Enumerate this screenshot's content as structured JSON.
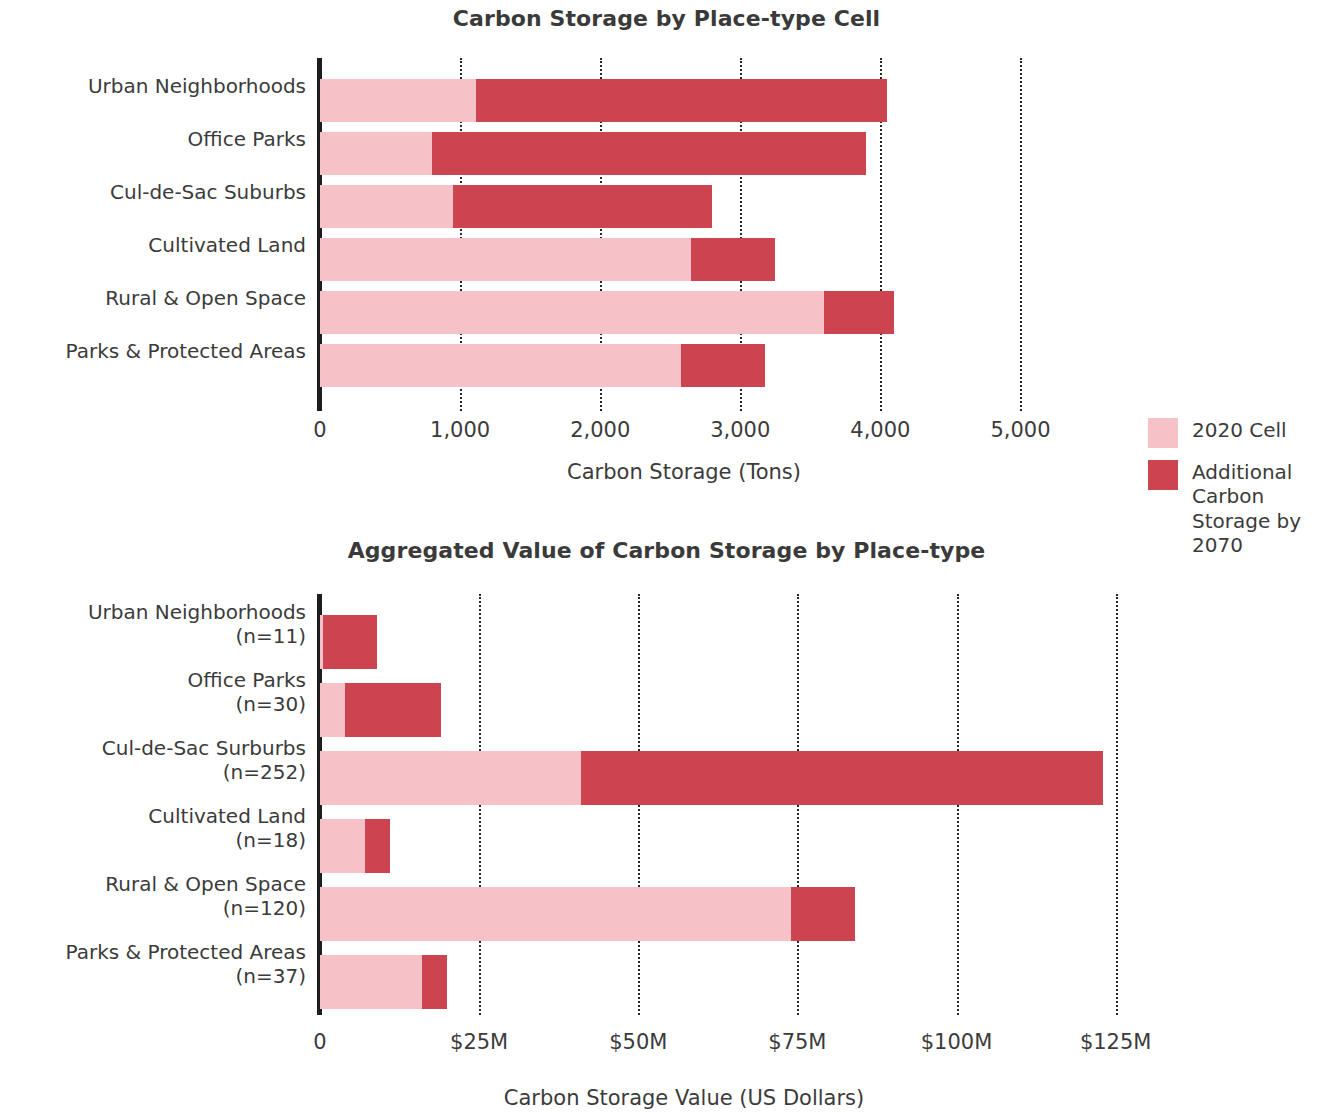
{
  "legend": {
    "items": [
      {
        "label": "2020 Cell",
        "color": "#f6c2c8",
        "key": "base"
      },
      {
        "label": "Additional Carbon Storage by 2070",
        "color": "#cc4450",
        "key": "additional"
      }
    ]
  },
  "charts": [
    {
      "id": "carbon-storage-by-cell",
      "title": "Carbon Storage by Place-type Cell",
      "xlabel": "Carbon Storage (Tons)",
      "ticks": [
        "0",
        "1,000",
        "2,000",
        "3,000",
        "4,000",
        "5,000"
      ],
      "categories": [
        "Urban Neighborhoods",
        "Office Parks",
        "Cul-de-Sac Suburbs",
        "Cultivated Land",
        "Rural & Open Space",
        "Parks & Protected Areas"
      ],
      "sublabels": [
        "",
        "",
        "",
        "",
        "",
        ""
      ]
    },
    {
      "id": "aggregated-value-by-placetype",
      "title": "Aggregated Value of Carbon Storage by Place-type",
      "xlabel": "Carbon Storage Value (US Dollars)",
      "ticks": [
        "0",
        "$25M",
        "$50M",
        "$75M",
        "$100M",
        "$125M"
      ],
      "categories": [
        "Urban Neighborhoods",
        "Office Parks",
        "Cul-de-Sac Surburbs",
        "Cultivated Land",
        "Rural & Open Space",
        "Parks & Protected Areas"
      ],
      "sublabels": [
        "(n=11)",
        "(n=30)",
        "(n=252)",
        "(n=18)",
        "(n=120)",
        "(n=37)"
      ]
    }
  ],
  "chart_data": [
    {
      "type": "bar",
      "orientation": "horizontal",
      "stacked": true,
      "title": "Carbon Storage by Place-type Cell",
      "xlabel": "Carbon Storage (Tons)",
      "ylabel": "",
      "xlim": [
        0,
        5200
      ],
      "xticks": [
        0,
        1000,
        2000,
        3000,
        4000,
        5000
      ],
      "xticklabels": [
        "0",
        "1,000",
        "2,000",
        "3,000",
        "4,000",
        "5,000"
      ],
      "grid": "x-dotted",
      "legend_position": "right",
      "categories": [
        "Urban Neighborhoods",
        "Office Parks",
        "Cul-de-Sac Suburbs",
        "Cultivated Land",
        "Rural & Open Space",
        "Parks & Protected Areas"
      ],
      "series": [
        {
          "name": "2020 Cell",
          "color": "#f6c2c8",
          "values": [
            1110,
            800,
            950,
            2650,
            3600,
            2580
          ]
        },
        {
          "name": "Additional Carbon Storage by 2070",
          "color": "#cc4450",
          "values": [
            2940,
            3100,
            1850,
            600,
            500,
            600
          ]
        }
      ],
      "totals": [
        4050,
        3900,
        2800,
        3250,
        4100,
        3180
      ]
    },
    {
      "type": "bar",
      "orientation": "horizontal",
      "stacked": true,
      "title": "Aggregated Value of Carbon Storage by Place-type",
      "xlabel": "Carbon Storage Value (US Dollars)",
      "ylabel": "",
      "units": "millions of US dollars",
      "xlim": [
        0,
        130
      ],
      "xticks": [
        0,
        25,
        50,
        75,
        100,
        125
      ],
      "xticklabels": [
        "0",
        "$25M",
        "$50M",
        "$75M",
        "$100M",
        "$125M"
      ],
      "grid": "x-dotted",
      "legend_position": "right",
      "categories": [
        "Urban Neighborhoods (n=11)",
        "Office Parks (n=30)",
        "Cul-de-Sac Surburbs (n=252)",
        "Cultivated Land (n=18)",
        "Rural & Open Space (n=120)",
        "Parks & Protected Areas (n=37)"
      ],
      "counts": [
        11,
        30,
        252,
        18,
        120,
        37
      ],
      "series": [
        {
          "name": "2020 Cell",
          "color": "#f6c2c8",
          "values": [
            0.5,
            4,
            41,
            7,
            74,
            16
          ]
        },
        {
          "name": "Additional Carbon Storage by 2070",
          "color": "#cc4450",
          "values": [
            8.5,
            15,
            82,
            4,
            10,
            4
          ]
        }
      ],
      "totals": [
        9,
        19,
        123,
        11,
        84,
        20
      ]
    }
  ]
}
